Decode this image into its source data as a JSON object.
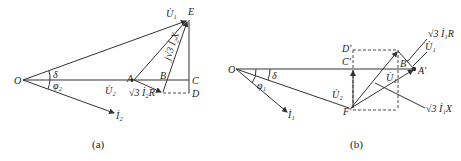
{
  "figure_a": {
    "caption": "(a)",
    "labels": {
      "O": "O",
      "E": "E",
      "A": "A",
      "B": "B",
      "C": "C",
      "D": "D",
      "U1": "U̇₁",
      "U2": "U̇₂",
      "I2": "İ₂",
      "delta": "δ",
      "phi2": "φ₂",
      "sqrt3_I2R": "√3 İ₂R",
      "j_sqrt3_I2X": "j√3 İ₂X"
    }
  },
  "figure_b": {
    "caption": "(b)",
    "labels": {
      "O": "O",
      "A": "A'",
      "B": "B'",
      "C": "C'",
      "D": "D'",
      "F": "F'",
      "U1_top": "U̇₁",
      "U1_inner": "U̇₁",
      "U2": "U̇₂",
      "I1": "İ₁",
      "delta": "δ",
      "phi1": "φ₁",
      "sqrt3_I1R": "√3 İ₁R",
      "sqrt3_I1X": "√3 İ₁X"
    }
  },
  "colors": {
    "line": "#333333",
    "text": "#222222",
    "background": "#ffffff"
  }
}
